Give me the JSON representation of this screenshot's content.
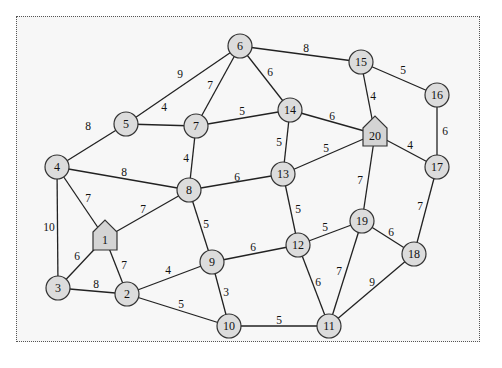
{
  "diagram": {
    "type": "weighted-undirected-graph",
    "special_nodes": [
      "1",
      "20"
    ],
    "special_shape": "house",
    "nodes": [
      {
        "id": "1",
        "x": 105,
        "y": 238,
        "shape": "house"
      },
      {
        "id": "2",
        "x": 127,
        "y": 294,
        "shape": "circle"
      },
      {
        "id": "3",
        "x": 58,
        "y": 288,
        "shape": "circle"
      },
      {
        "id": "4",
        "x": 57,
        "y": 167,
        "shape": "circle"
      },
      {
        "id": "5",
        "x": 126,
        "y": 124,
        "shape": "circle"
      },
      {
        "id": "6",
        "x": 240,
        "y": 46,
        "shape": "circle"
      },
      {
        "id": "7",
        "x": 196,
        "y": 126,
        "shape": "circle"
      },
      {
        "id": "8",
        "x": 189,
        "y": 190,
        "shape": "circle"
      },
      {
        "id": "9",
        "x": 212,
        "y": 262,
        "shape": "circle"
      },
      {
        "id": "10",
        "x": 229,
        "y": 326,
        "shape": "circle"
      },
      {
        "id": "11",
        "x": 329,
        "y": 326,
        "shape": "circle"
      },
      {
        "id": "12",
        "x": 298,
        "y": 245,
        "shape": "circle"
      },
      {
        "id": "13",
        "x": 283,
        "y": 174,
        "shape": "circle"
      },
      {
        "id": "14",
        "x": 290,
        "y": 110,
        "shape": "circle"
      },
      {
        "id": "15",
        "x": 361,
        "y": 62,
        "shape": "circle"
      },
      {
        "id": "16",
        "x": 437,
        "y": 95,
        "shape": "circle"
      },
      {
        "id": "17",
        "x": 437,
        "y": 167,
        "shape": "circle"
      },
      {
        "id": "18",
        "x": 414,
        "y": 254,
        "shape": "circle"
      },
      {
        "id": "19",
        "x": 362,
        "y": 221,
        "shape": "circle"
      },
      {
        "id": "20",
        "x": 375,
        "y": 134,
        "shape": "house"
      }
    ],
    "edges": [
      {
        "from": "6",
        "to": "5",
        "weight": "9",
        "lx": 180,
        "ly": 74
      },
      {
        "from": "6",
        "to": "7",
        "weight": "7",
        "lx": 210,
        "ly": 85
      },
      {
        "from": "6",
        "to": "14",
        "weight": "6",
        "lx": 270,
        "ly": 72
      },
      {
        "from": "6",
        "to": "15",
        "weight": "8",
        "lx": 306,
        "ly": 48
      },
      {
        "from": "5",
        "to": "7",
        "weight": "4",
        "lx": 164,
        "ly": 107
      },
      {
        "from": "5",
        "to": "4",
        "weight": "8",
        "lx": 88,
        "ly": 126
      },
      {
        "from": "7",
        "to": "14",
        "weight": "5",
        "lx": 242,
        "ly": 111
      },
      {
        "from": "7",
        "to": "8",
        "weight": "4",
        "lx": 186,
        "ly": 158
      },
      {
        "from": "4",
        "to": "8",
        "weight": "8",
        "lx": 124,
        "ly": 172
      },
      {
        "from": "4",
        "to": "1",
        "weight": "7",
        "lx": 88,
        "ly": 198
      },
      {
        "from": "4",
        "to": "3",
        "weight": "10",
        "lx": 49,
        "ly": 227
      },
      {
        "from": "8",
        "to": "1",
        "weight": "7",
        "lx": 143,
        "ly": 209
      },
      {
        "from": "8",
        "to": "13",
        "weight": "6",
        "lx": 237,
        "ly": 177
      },
      {
        "from": "8",
        "to": "9",
        "weight": "5",
        "lx": 206,
        "ly": 224
      },
      {
        "from": "14",
        "to": "13",
        "weight": "5",
        "lx": 279,
        "ly": 142
      },
      {
        "from": "14",
        "to": "20",
        "weight": "6",
        "lx": 332,
        "ly": 116
      },
      {
        "from": "15",
        "to": "20",
        "weight": "4",
        "lx": 373,
        "ly": 96
      },
      {
        "from": "15",
        "to": "16",
        "weight": "5",
        "lx": 403,
        "ly": 70
      },
      {
        "from": "16",
        "to": "17",
        "weight": "6",
        "lx": 445,
        "ly": 131
      },
      {
        "from": "20",
        "to": "13",
        "weight": "5",
        "lx": 326,
        "ly": 148
      },
      {
        "from": "20",
        "to": "17",
        "weight": "4",
        "lx": 410,
        "ly": 145
      },
      {
        "from": "20",
        "to": "19",
        "weight": "7",
        "lx": 360,
        "ly": 180
      },
      {
        "from": "13",
        "to": "12",
        "weight": "5",
        "lx": 298,
        "ly": 209
      },
      {
        "from": "1",
        "to": "3",
        "weight": "6",
        "lx": 77,
        "ly": 256
      },
      {
        "from": "1",
        "to": "2",
        "weight": "7",
        "lx": 124,
        "ly": 265
      },
      {
        "from": "3",
        "to": "2",
        "weight": "8",
        "lx": 96,
        "ly": 284
      },
      {
        "from": "2",
        "to": "9",
        "weight": "4",
        "lx": 168,
        "ly": 270
      },
      {
        "from": "2",
        "to": "10",
        "weight": "5",
        "lx": 181,
        "ly": 304
      },
      {
        "from": "9",
        "to": "10",
        "weight": "3",
        "lx": 226,
        "ly": 292
      },
      {
        "from": "9",
        "to": "12",
        "weight": "6",
        "lx": 253,
        "ly": 247
      },
      {
        "from": "12",
        "to": "19",
        "weight": "5",
        "lx": 325,
        "ly": 227
      },
      {
        "from": "12",
        "to": "11",
        "weight": "6",
        "lx": 318,
        "ly": 282
      },
      {
        "from": "19",
        "to": "11",
        "weight": "7",
        "lx": 339,
        "ly": 271
      },
      {
        "from": "19",
        "to": "18",
        "weight": "6",
        "lx": 391,
        "ly": 232
      },
      {
        "from": "17",
        "to": "18",
        "weight": "7",
        "lx": 420,
        "ly": 206
      },
      {
        "from": "18",
        "to": "11",
        "weight": "9",
        "lx": 372,
        "ly": 282
      },
      {
        "from": "10",
        "to": "11",
        "weight": "5",
        "lx": 279,
        "ly": 320
      }
    ]
  }
}
